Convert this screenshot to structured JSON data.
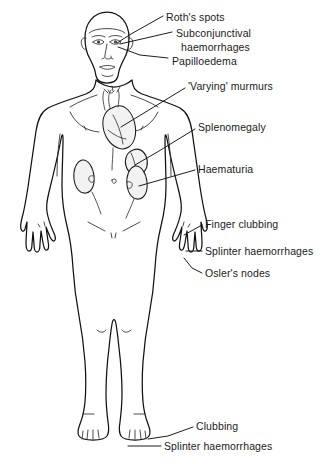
{
  "diagram": {
    "stroke_color": "#111111",
    "text_color": "#1a1a1a",
    "background_color": "#ffffff",
    "organ_fill_color": "#f2f2f2"
  },
  "labels": [
    {
      "id": "roths-spots",
      "text": "Roth's spots",
      "x": 166,
      "y": 11,
      "target": "eye"
    },
    {
      "id": "subconjunctival",
      "text": "Subconjunctival",
      "x": 176,
      "y": 27,
      "target": "eye"
    },
    {
      "id": "haemorrhages-eye",
      "text": "haemorrhages",
      "x": 181,
      "y": 41,
      "target": "eye"
    },
    {
      "id": "papilloedema",
      "text": "Papilloedema",
      "x": 172,
      "y": 55,
      "target": "eye"
    },
    {
      "id": "varying-murmurs",
      "text": "'Varying' murmurs",
      "x": 188,
      "y": 86,
      "target": "heart"
    },
    {
      "id": "splenomegaly",
      "text": "Splenomegaly",
      "x": 198,
      "y": 126,
      "target": "spleen"
    },
    {
      "id": "haematuria",
      "text": "Haematuria",
      "x": 198,
      "y": 167,
      "target": "kidney"
    },
    {
      "id": "finger-clubbing",
      "text": "Finger clubbing",
      "x": 205,
      "y": 221,
      "target": "hand"
    },
    {
      "id": "splinter-haemorrhages-hand",
      "text": "Splinter haemorrhages",
      "x": 205,
      "y": 248,
      "target": "hand"
    },
    {
      "id": "oslers-nodes",
      "text": "Osler's nodes",
      "x": 205,
      "y": 270,
      "target": "hand"
    },
    {
      "id": "clubbing-toe",
      "text": "Clubbing",
      "x": 196,
      "y": 424,
      "target": "foot"
    },
    {
      "id": "splinter-haemorrhages-foot",
      "text": "Splinter haemorrhages",
      "x": 164,
      "y": 443,
      "target": "foot"
    }
  ],
  "anatomy_parts": [
    "head",
    "face",
    "eyes",
    "nose",
    "mouth",
    "ears",
    "neck",
    "shoulders",
    "chest",
    "heart",
    "aorta",
    "abdomen",
    "navel",
    "left-kidney",
    "right-kidney",
    "spleen",
    "ureters",
    "arms",
    "left-hand",
    "right-hand",
    "pelvis",
    "legs",
    "knees",
    "left-foot",
    "right-foot"
  ]
}
